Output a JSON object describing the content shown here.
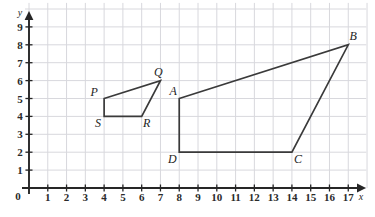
{
  "chart_data": {
    "type": "scatter",
    "title": "",
    "xlabel": "x",
    "ylabel": "y",
    "xlim": [
      0,
      17
    ],
    "ylim": [
      0,
      9
    ],
    "grid": true,
    "legend": "none",
    "x_ticks": [
      "0",
      "1",
      "2",
      "3",
      "4",
      "5",
      "6",
      "7",
      "8",
      "9",
      "10",
      "11",
      "12",
      "13",
      "14",
      "15",
      "16",
      "17"
    ],
    "y_ticks": [
      "0",
      "1",
      "2",
      "3",
      "4",
      "5",
      "6",
      "7",
      "8",
      "9"
    ],
    "annotations": [
      {
        "label": "P",
        "x": 4,
        "y": 5
      },
      {
        "label": "Q",
        "x": 7,
        "y": 6
      },
      {
        "label": "R",
        "x": 6,
        "y": 4
      },
      {
        "label": "S",
        "x": 4,
        "y": 4
      },
      {
        "label": "A",
        "x": 8,
        "y": 5
      },
      {
        "label": "B",
        "x": 17,
        "y": 8
      },
      {
        "label": "C",
        "x": 14,
        "y": 2
      },
      {
        "label": "D",
        "x": 8,
        "y": 2
      }
    ],
    "series": [
      {
        "name": "PQRS",
        "closed": true,
        "vertices": [
          {
            "label": "P",
            "x": 4,
            "y": 5
          },
          {
            "label": "Q",
            "x": 7,
            "y": 6
          },
          {
            "label": "R",
            "x": 6,
            "y": 4
          },
          {
            "label": "S",
            "x": 4,
            "y": 4
          }
        ]
      },
      {
        "name": "ABCD",
        "closed": true,
        "vertices": [
          {
            "label": "A",
            "x": 8,
            "y": 5
          },
          {
            "label": "B",
            "x": 17,
            "y": 8
          },
          {
            "label": "C",
            "x": 14,
            "y": 2
          },
          {
            "label": "D",
            "x": 8,
            "y": 2
          }
        ]
      }
    ]
  },
  "axes": {
    "x_name": "x",
    "y_name": "y",
    "origin_label": "0"
  },
  "colors": {
    "grid": "#d8d8dd",
    "axis": "#262626",
    "shape_stroke": "#3a3a3a",
    "label_text": "#1d1d1d",
    "background": "#ffffff"
  },
  "labels": {
    "P": "P",
    "Q": "Q",
    "R": "R",
    "S": "S",
    "A": "A",
    "B": "B",
    "C": "C",
    "D": "D"
  }
}
